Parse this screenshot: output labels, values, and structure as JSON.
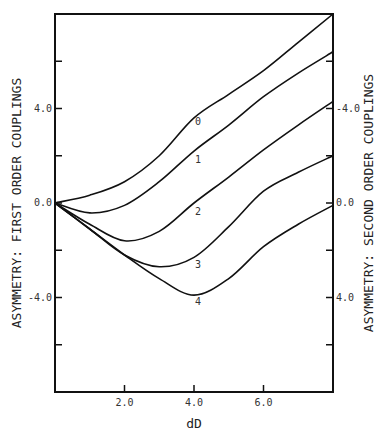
{
  "chart_data": {
    "type": "line",
    "title": "",
    "xlabel": "dD",
    "ylabel": "ASYMMETRY: FIRST ORDER COUPLINGS",
    "ylabel_right": "ASYMMETRY: SECOND ORDER COUPLINGS",
    "xlim": [
      0,
      8
    ],
    "ylim": [
      -8,
      8
    ],
    "x_ticks": [
      2,
      4,
      6
    ],
    "x_tick_labels": [
      "2.0",
      "4.0",
      "6.0"
    ],
    "y_ticks": [
      -6,
      -4,
      -2,
      0,
      2,
      4,
      6
    ],
    "y_tick_labels_left": {
      "4": "4.0",
      "0": "0.0",
      "-4": "-4.0"
    },
    "y_tick_labels_right": {
      "4": "-4.0",
      "0": "0.0",
      "-4": "4.0"
    },
    "grid": false,
    "legend": "inline curve labels",
    "x": [
      0,
      1,
      2,
      3,
      4,
      5,
      6,
      7,
      8
    ],
    "series": [
      {
        "name": "0",
        "values": [
          0,
          0.33,
          0.9,
          2.0,
          3.6,
          4.6,
          5.6,
          6.8,
          8.0
        ],
        "label_pos": [
          4.0,
          3.3
        ]
      },
      {
        "name": "1",
        "values": [
          0,
          -0.42,
          -0.1,
          0.9,
          2.2,
          3.3,
          4.5,
          5.5,
          6.4
        ],
        "label_pos": [
          4.0,
          1.7
        ]
      },
      {
        "name": "2",
        "values": [
          0,
          -0.9,
          -1.6,
          -1.2,
          0.0,
          1.1,
          2.25,
          3.3,
          4.3
        ],
        "label_pos": [
          4.0,
          -0.5
        ]
      },
      {
        "name": "3",
        "values": [
          0,
          -1.1,
          -2.2,
          -2.7,
          -2.3,
          -1.0,
          0.5,
          1.3,
          2.0
        ],
        "label_pos": [
          4.0,
          -2.75
        ]
      },
      {
        "name": "4",
        "values": [
          0,
          -1.1,
          -2.2,
          -3.2,
          -3.9,
          -3.2,
          -1.85,
          -0.9,
          -0.1
        ],
        "label_pos": [
          4.0,
          -4.3
        ]
      }
    ]
  }
}
